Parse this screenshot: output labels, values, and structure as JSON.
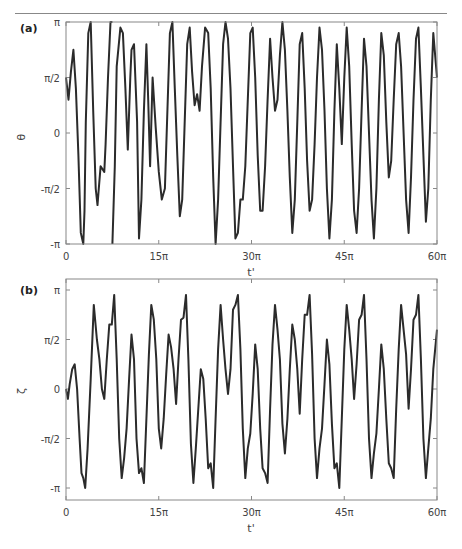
{
  "chart_data": [
    {
      "type": "line",
      "panel_label": "(a)",
      "title": "",
      "xlabel": "t'",
      "ylabel": "θ",
      "xlim": [
        0,
        60
      ],
      "ylim": [
        -3.1416,
        3.1416
      ],
      "x_unit": "π",
      "y_unit": "π",
      "grid": false,
      "legend": null,
      "xticks": [
        {
          "value": 0,
          "label": "0"
        },
        {
          "value": 15,
          "label": "15π"
        },
        {
          "value": 30,
          "label": "30π"
        },
        {
          "value": 45,
          "label": "45π"
        },
        {
          "value": 60,
          "label": "60π"
        }
      ],
      "yticks": [
        {
          "value": 1,
          "label": "π"
        },
        {
          "value": 0.5,
          "label": "π/2"
        },
        {
          "value": 0,
          "label": "0"
        },
        {
          "value": -0.5,
          "label": "-π/2"
        },
        {
          "value": -1,
          "label": "-π"
        }
      ],
      "note": "θ wrapped to [-π, π]; x in units of π, y in units of π",
      "series": [
        {
          "name": "theta",
          "x": [
            0,
            0.4,
            0.8,
            1.2,
            1.6,
            2.0,
            2.4,
            2.8,
            3.0,
            3.2,
            3.6,
            4.0,
            4.4,
            4.8,
            5.1,
            5.3,
            5.6,
            6.2,
            6.4,
            6.8,
            7.2,
            7.5,
            7.9,
            8.2,
            8.8,
            9.2,
            9.6,
            10.0,
            10.4,
            10.6,
            11.0,
            11.5,
            11.8,
            12.2,
            12.6,
            13.0,
            13.3,
            13.6,
            14.0,
            14.5,
            15.0,
            15.5,
            16.0,
            16.4,
            16.8,
            17.2,
            17.6,
            18.0,
            18.4,
            18.8,
            19.2,
            19.6,
            20.0,
            20.4,
            20.8,
            21.2,
            21.6,
            22.0,
            22.5,
            23.0,
            23.4,
            23.8,
            24.2,
            24.6,
            25.0,
            25.4,
            25.8,
            26.2,
            26.6,
            27.0,
            27.4,
            27.8,
            28.2,
            28.6,
            29.0,
            29.4,
            29.8,
            30.2,
            30.6,
            31.0,
            31.4,
            31.8,
            32.2,
            32.6,
            33.0,
            33.4,
            33.8,
            34.2,
            34.6,
            35.0,
            35.4,
            35.8,
            36.2,
            36.6,
            37.0,
            37.4,
            37.8,
            38.2,
            38.6,
            39.0,
            39.4,
            39.8,
            40.2,
            40.6,
            41.0,
            41.4,
            41.8,
            42.2,
            42.6,
            43.0,
            43.4,
            43.8,
            44.2,
            44.6,
            45.0,
            45.4,
            45.8,
            46.2,
            46.6,
            47.0,
            47.4,
            47.8,
            48.2,
            48.6,
            49.0,
            49.4,
            49.8,
            50.2,
            50.6,
            51.0,
            51.4,
            51.8,
            52.2,
            52.6,
            53.0,
            53.4,
            53.8,
            54.2,
            54.6,
            55.0,
            55.4,
            55.8,
            56.2,
            56.6,
            57.0,
            57.4,
            57.8,
            58.2,
            58.6,
            59.0,
            59.4,
            60.0
          ],
          "y": [
            0.5,
            0.3,
            0.55,
            0.75,
            0.4,
            -0.2,
            -0.9,
            -1.0,
            -0.7,
            0.1,
            0.9,
            1.0,
            0.2,
            -0.5,
            -0.65,
            -0.5,
            -0.3,
            -0.35,
            -0.1,
            0.5,
            1.0,
            -1.0,
            -0.3,
            0.6,
            0.95,
            0.9,
            0.4,
            -0.15,
            0.5,
            0.75,
            0.8,
            0.1,
            -0.95,
            -0.6,
            0.2,
            0.8,
            0.3,
            -0.3,
            0.5,
            0.05,
            -0.35,
            -0.6,
            -0.5,
            0.2,
            0.9,
            1.0,
            0.4,
            -0.2,
            -0.75,
            -0.6,
            0.1,
            0.8,
            0.95,
            0.55,
            0.25,
            0.35,
            0.2,
            0.6,
            0.95,
            0.9,
            0.4,
            -0.4,
            -1.0,
            -0.6,
            0.1,
            0.8,
            1.0,
            0.85,
            0.4,
            -0.3,
            -0.95,
            -0.9,
            -0.6,
            -0.6,
            -0.3,
            0.3,
            0.9,
            0.95,
            0.5,
            -0.2,
            -0.7,
            -0.7,
            -0.3,
            0.3,
            0.85,
            0.5,
            0.2,
            0.3,
            0.7,
            1.0,
            0.75,
            0.2,
            -0.4,
            -0.9,
            -0.6,
            0.1,
            0.8,
            0.9,
            0.4,
            -0.25,
            -0.7,
            -0.6,
            -0.1,
            0.5,
            0.95,
            0.75,
            0.2,
            -0.5,
            -0.95,
            -0.6,
            0.2,
            0.8,
            0.4,
            -0.1,
            0.5,
            0.95,
            0.6,
            -0.1,
            -0.7,
            -0.9,
            -0.5,
            0.2,
            0.85,
            0.6,
            0.0,
            -0.6,
            -0.95,
            -0.5,
            0.3,
            0.9,
            0.7,
            0.1,
            -0.4,
            -0.25,
            0.3,
            0.8,
            0.9,
            0.6,
            0.0,
            -0.6,
            -0.9,
            -0.4,
            0.3,
            0.85,
            0.95,
            0.4,
            -0.2,
            -0.8,
            -0.5,
            0.3,
            0.9,
            0.5,
            -0.3,
            -0.9
          ]
        }
      ]
    },
    {
      "type": "line",
      "panel_label": "(b)",
      "title": "",
      "xlabel": "t'",
      "ylabel": "ζ",
      "xlim": [
        0,
        60
      ],
      "ylim": [
        -1.15,
        1.15
      ],
      "x_unit": "π",
      "y_unit": "π",
      "grid": false,
      "legend": null,
      "xticks": [
        {
          "value": 0,
          "label": "0"
        },
        {
          "value": 15,
          "label": "15π"
        },
        {
          "value": 30,
          "label": "30π"
        },
        {
          "value": 45,
          "label": "45π"
        },
        {
          "value": 60,
          "label": "60π"
        }
      ],
      "yticks": [
        {
          "value": 1,
          "label": "π"
        },
        {
          "value": 0.5,
          "label": "π/2"
        },
        {
          "value": 0,
          "label": "0"
        },
        {
          "value": -0.5,
          "label": "-π/2"
        },
        {
          "value": -1,
          "label": "-π"
        }
      ],
      "series": [
        {
          "name": "zeta",
          "x": [
            0,
            0.3,
            0.6,
            1.0,
            1.4,
            1.8,
            2.2,
            2.5,
            2.8,
            3.1,
            3.5,
            4.0,
            4.5,
            5.0,
            5.4,
            5.8,
            6.2,
            6.6,
            7.0,
            7.4,
            7.8,
            8.2,
            8.6,
            9.0,
            9.4,
            9.8,
            10.2,
            10.6,
            11.0,
            11.4,
            11.8,
            12.2,
            12.6,
            13.0,
            13.4,
            13.8,
            14.2,
            14.6,
            15.0,
            15.4,
            15.8,
            16.2,
            16.6,
            17.0,
            17.4,
            17.8,
            18.2,
            18.6,
            19.0,
            19.4,
            19.8,
            20.2,
            20.6,
            21.0,
            21.4,
            21.8,
            22.2,
            22.6,
            23.0,
            23.4,
            23.8,
            24.2,
            24.6,
            25.0,
            25.4,
            25.8,
            26.2,
            26.6,
            27.0,
            27.4,
            27.8,
            28.2,
            28.6,
            29.0,
            29.4,
            29.8,
            30.2,
            30.6,
            31.0,
            31.4,
            31.8,
            32.2,
            32.6,
            33.0,
            33.4,
            33.8,
            34.2,
            34.6,
            35.0,
            35.4,
            35.8,
            36.2,
            36.6,
            37.0,
            37.4,
            37.8,
            38.2,
            38.6,
            39.0,
            39.4,
            39.8,
            40.2,
            40.6,
            41.0,
            41.4,
            41.8,
            42.2,
            42.6,
            43.0,
            43.4,
            43.8,
            44.2,
            44.6,
            45.0,
            45.4,
            45.8,
            46.2,
            46.6,
            47.0,
            47.4,
            47.8,
            48.2,
            48.6,
            49.0,
            49.4,
            49.8,
            50.2,
            50.6,
            51.0,
            51.4,
            51.8,
            52.2,
            52.6,
            53.0,
            53.4,
            53.8,
            54.2,
            54.6,
            55.0,
            55.4,
            55.8,
            56.2,
            56.6,
            57.0,
            57.4,
            57.8,
            58.2,
            58.6,
            59.0,
            59.4,
            60.0
          ],
          "y": [
            0.0,
            -0.1,
            0.05,
            0.2,
            0.25,
            0.0,
            -0.5,
            -0.85,
            -0.9,
            -1.0,
            -0.6,
            0.1,
            0.85,
            0.5,
            0.3,
            0.0,
            -0.1,
            0.3,
            0.65,
            0.65,
            0.95,
            0.3,
            -0.5,
            -0.9,
            -0.7,
            -0.4,
            0.1,
            0.55,
            0.3,
            -0.5,
            -0.85,
            -0.8,
            -0.95,
            -0.3,
            0.35,
            0.85,
            0.7,
            0.3,
            -0.4,
            -0.6,
            -0.3,
            0.15,
            0.55,
            0.42,
            0.2,
            -0.15,
            0.3,
            0.7,
            0.72,
            0.95,
            0.3,
            -0.55,
            -0.95,
            -0.6,
            -0.2,
            0.2,
            0.1,
            -0.3,
            -0.8,
            -0.75,
            -1.0,
            -0.3,
            0.4,
            0.85,
            0.5,
            0.2,
            -0.05,
            0.2,
            0.8,
            0.85,
            0.95,
            0.4,
            -0.4,
            -0.9,
            -0.6,
            -0.45,
            -0.05,
            0.45,
            0.2,
            -0.4,
            -0.8,
            -0.85,
            -0.95,
            -0.2,
            0.45,
            0.85,
            0.6,
            0.3,
            -0.35,
            -0.65,
            -0.3,
            0.2,
            0.65,
            0.5,
            0.2,
            -0.25,
            0.3,
            0.75,
            0.75,
            0.95,
            0.35,
            -0.5,
            -0.9,
            -0.6,
            -0.4,
            0.05,
            0.5,
            0.25,
            -0.35,
            -0.8,
            -0.75,
            -1.0,
            -0.3,
            0.4,
            0.85,
            0.6,
            0.3,
            -0.1,
            0.25,
            0.7,
            0.75,
            0.95,
            0.3,
            -0.5,
            -0.9,
            -0.65,
            -0.45,
            0.0,
            0.45,
            0.2,
            -0.3,
            -0.75,
            -0.8,
            -0.9,
            -0.2,
            0.4,
            0.85,
            0.6,
            0.35,
            -0.2,
            0.2,
            0.7,
            0.75,
            0.95,
            0.3,
            -0.5,
            -0.9,
            -0.6,
            -0.3,
            0.2,
            0.6,
            0.7,
            0.95,
            0.3,
            -0.8,
            -0.5
          ]
        }
      ]
    }
  ],
  "panels": {
    "a": {
      "label": "(a)",
      "xlabel": "t'",
      "ylabel": "θ"
    },
    "b": {
      "label": "(b)",
      "xlabel": "t'",
      "ylabel": "ζ"
    }
  },
  "style": {
    "line_color": "#2b2b2b",
    "frame_color": "#888888",
    "text_color": "#444444"
  }
}
